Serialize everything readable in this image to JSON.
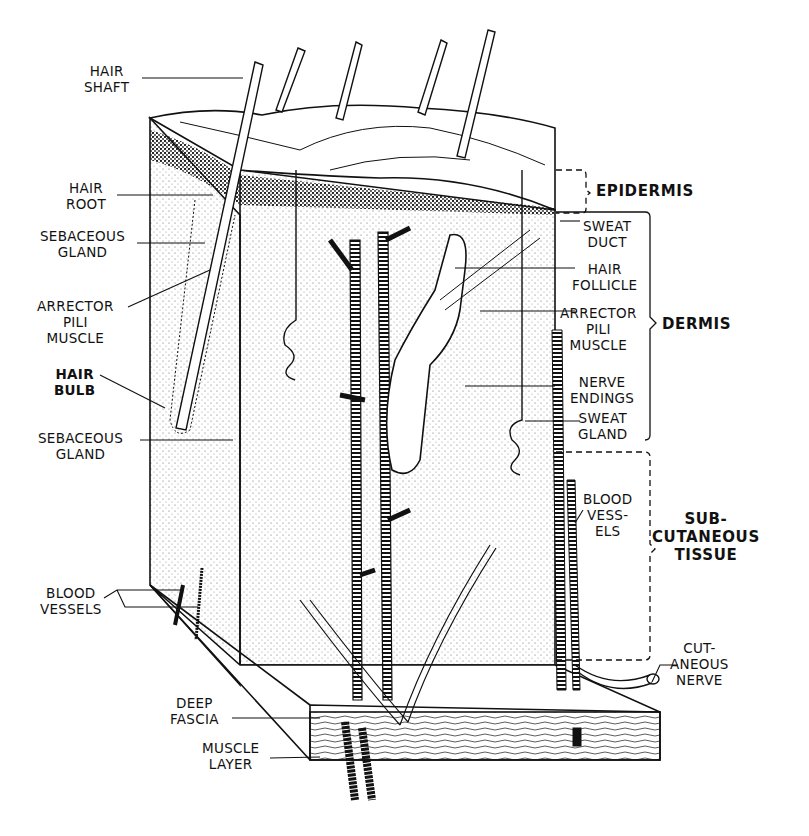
{
  "diagram": {
    "style": "black-and-white line illustration",
    "colors": {
      "ink": "#111111",
      "background": "#ffffff",
      "stipple": "#555555"
    }
  },
  "layers": {
    "epidermis": {
      "lines": [
        "EPIDERMIS"
      ]
    },
    "dermis": {
      "lines": [
        "DERMIS"
      ]
    },
    "subcutaneous": {
      "lines": [
        "SUB-",
        "CUTANEOUS",
        "TISSUE"
      ]
    }
  },
  "left_labels": [
    {
      "id": "hair-shaft",
      "lines": [
        "HAIR",
        "SHAFT"
      ]
    },
    {
      "id": "hair-root",
      "lines": [
        "HAIR",
        "ROOT"
      ]
    },
    {
      "id": "sebaceous-gland-upper",
      "lines": [
        "SEBACEOUS",
        "GLAND"
      ]
    },
    {
      "id": "arrector-pili-left",
      "lines": [
        "ARRECTOR",
        "PILI",
        "MUSCLE"
      ]
    },
    {
      "id": "hair-bulb",
      "lines": [
        "HAIR",
        "BULB"
      ]
    },
    {
      "id": "sebaceous-gland-lower",
      "lines": [
        "SEBACEOUS",
        "GLAND"
      ]
    },
    {
      "id": "blood-vessels-left",
      "lines": [
        "BLOOD",
        "VESSELS"
      ]
    },
    {
      "id": "deep-fascia",
      "lines": [
        "DEEP",
        "FASCIA"
      ]
    },
    {
      "id": "muscle-layer",
      "lines": [
        "MUSCLE",
        "LAYER"
      ]
    }
  ],
  "right_labels": [
    {
      "id": "sweat-duct",
      "lines": [
        "SWEAT",
        "DUCT"
      ]
    },
    {
      "id": "hair-follicle",
      "lines": [
        "HAIR",
        "FOLLICLE"
      ]
    },
    {
      "id": "arrector-pili-right",
      "lines": [
        "ARRECTOR",
        "PILI",
        "MUSCLE"
      ]
    },
    {
      "id": "nerve-endings",
      "lines": [
        "NERVE",
        "ENDINGS"
      ]
    },
    {
      "id": "sweat-gland",
      "lines": [
        "SWEAT",
        "GLAND"
      ]
    },
    {
      "id": "blood-vessels-right",
      "lines": [
        "BLOOD",
        "VESS-",
        "ELS"
      ]
    },
    {
      "id": "cutaneous-nerve",
      "lines": [
        "CUT-",
        "ANEOUS",
        "NERVE"
      ]
    }
  ]
}
